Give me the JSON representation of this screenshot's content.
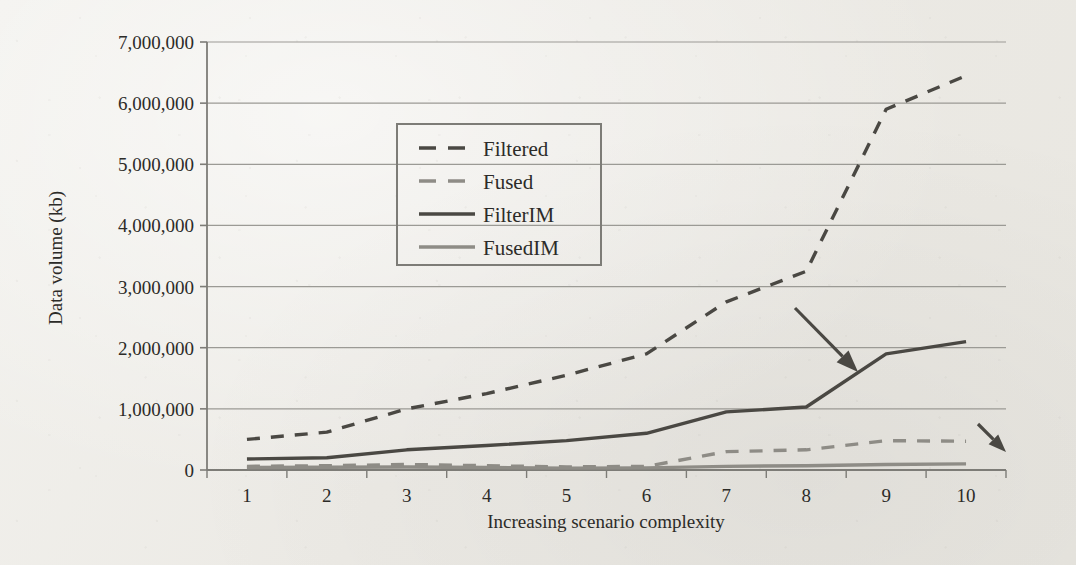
{
  "chart_data": {
    "type": "line",
    "title": "",
    "xlabel": "Increasing scenario complexity",
    "ylabel": "Data volume (kb)",
    "categories": [
      "1",
      "2",
      "3",
      "4",
      "5",
      "6",
      "7",
      "8",
      "9",
      "10"
    ],
    "x": [
      1,
      2,
      3,
      4,
      5,
      6,
      7,
      8,
      9,
      10
    ],
    "ylim": [
      0,
      7000000
    ],
    "ytick_values": [
      0,
      1000000,
      2000000,
      3000000,
      4000000,
      5000000,
      6000000,
      7000000
    ],
    "ytick_labels": [
      "0",
      "1,000,000",
      "2,000,000",
      "3,000,000",
      "4,000,000",
      "5,000,000",
      "6,000,000",
      "7,000,000"
    ],
    "xtick_labels": [
      "1",
      "2",
      "3",
      "4",
      "5",
      "6",
      "7",
      "8",
      "9",
      "10"
    ],
    "grid": "horizontal",
    "legend_position": "upper-left-inside",
    "series": [
      {
        "name": "Filtered",
        "style": "dashed",
        "color": "#4a4843",
        "values": [
          500000,
          620000,
          1000000,
          1250000,
          1550000,
          1900000,
          2750000,
          3250000,
          5900000,
          6450000
        ]
      },
      {
        "name": "Fused",
        "style": "dashed",
        "color": "#8e8c86",
        "values": [
          60000,
          70000,
          90000,
          70000,
          50000,
          60000,
          300000,
          330000,
          480000,
          470000
        ]
      },
      {
        "name": "FilterIM",
        "style": "solid",
        "color": "#4a4843",
        "values": [
          180000,
          200000,
          330000,
          400000,
          480000,
          600000,
          950000,
          1030000,
          1900000,
          2100000
        ]
      },
      {
        "name": "FusedIM",
        "style": "solid",
        "color": "#8e8c86",
        "values": [
          40000,
          45000,
          50000,
          40000,
          30000,
          35000,
          60000,
          70000,
          90000,
          100000
        ]
      }
    ],
    "annotations": [
      {
        "name": "arrow-to-filterim",
        "type": "arrow",
        "from_x": 795,
        "from_y": 308,
        "to_x": 858,
        "to_y": 372
      },
      {
        "name": "arrow-to-fused",
        "type": "arrow",
        "from_x": 978,
        "from_y": 424,
        "to_x": 1006,
        "to_y": 452
      }
    ]
  },
  "axes": {
    "y_axis_title": "Data volume (kb)",
    "x_axis_title": "Increasing scenario complexity"
  },
  "legend": {
    "entries": [
      {
        "label": "Filtered"
      },
      {
        "label": "Fused"
      },
      {
        "label": "FilterIM"
      },
      {
        "label": "FusedIM"
      }
    ]
  },
  "colors": {
    "dark_series": "#4a4843",
    "light_series": "#8e8c86",
    "grid": "#9b9a95",
    "axis": "#7d7c77",
    "text": "#2c2b28",
    "paper": "#efeeea"
  }
}
